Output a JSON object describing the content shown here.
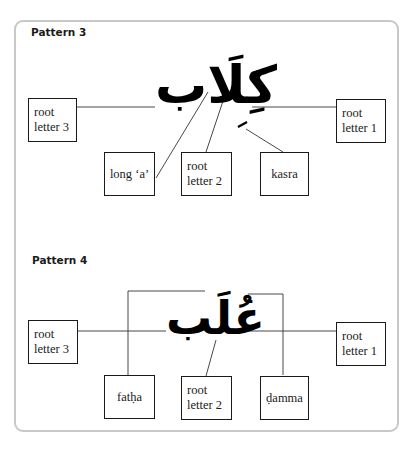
{
  "pattern3": {
    "title": "Pattern 3",
    "word": "كِلَاب",
    "boxes": {
      "root_letter_3": [
        "root",
        "letter 3"
      ],
      "root_letter_1": [
        "root",
        "letter 1"
      ],
      "long_a": "long ‘a’",
      "root_letter_2": [
        "root",
        "letter 2"
      ],
      "kasra": "kasra"
    }
  },
  "pattern4": {
    "title": "Pattern 4",
    "word": "عُلَب",
    "boxes": {
      "root_letter_3": [
        "root",
        "letter 3"
      ],
      "root_letter_1": [
        "root",
        "letter 1"
      ],
      "fatha": "fatḥa",
      "root_letter_2": [
        "root",
        "letter 2"
      ],
      "damma": "ḍamma"
    }
  },
  "colors": {
    "frame": "#c8c8c8",
    "ink": "#1a1a1a"
  }
}
